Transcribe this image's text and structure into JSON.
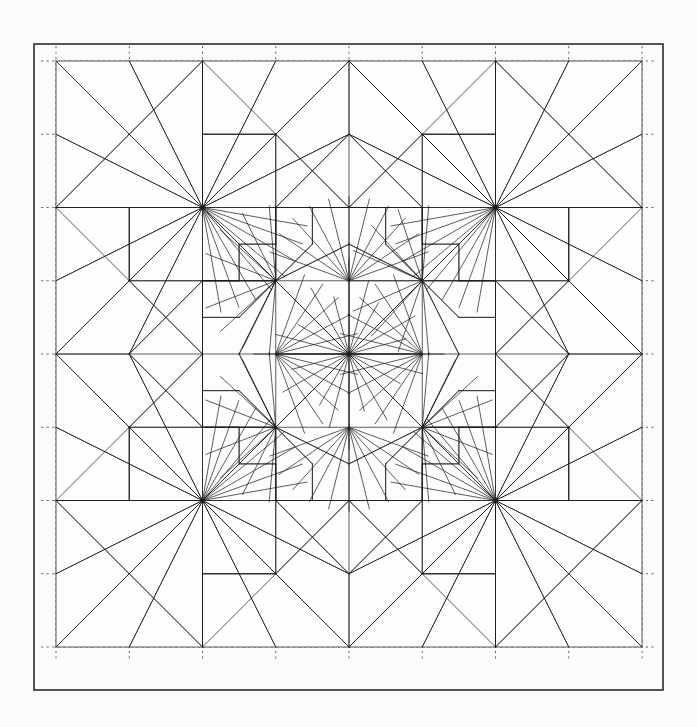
{
  "document": {
    "kind": "origami-crease-pattern",
    "title": "Crease Pattern",
    "caption": ""
  },
  "canvas": {
    "width": 697,
    "height": 727,
    "background_color": "#fbfbfa"
  },
  "frame": {
    "label": "outer-frame",
    "x": 34,
    "y": 44,
    "width": 629,
    "height": 646,
    "stroke_color": "#2b2b2b",
    "stroke_width": 1.6
  },
  "paper": {
    "label": "paper-square",
    "x": 56,
    "y": 61,
    "size": 586,
    "grid_divisions": 16,
    "stroke_color": "#555555"
  },
  "styles": {
    "crease_color": "#1d1d1d",
    "crease_width": 0.72,
    "guide_color": "#4a4a4a",
    "guide_width": 0.85,
    "guide_dash": "2.2 3.4"
  },
  "chart_data": {
    "type": "diagram",
    "grid": {
      "divisions": 16,
      "origin_x": 56,
      "origin_y": 61,
      "cell": 36.625,
      "guide_lines_at": [
        2,
        4,
        6,
        8,
        10,
        12,
        14
      ],
      "guide_overhang": 15
    },
    "symmetry": {
      "type": "dihedral-4",
      "center_u": 8,
      "center_v": 8,
      "mirrors": [
        "vertical",
        "horizontal",
        "diagonal",
        "antidiagonal"
      ]
    },
    "center_vertex": {
      "u": 8,
      "v": 8
    },
    "major_vertices": [
      {
        "u": 4,
        "v": 0
      },
      {
        "u": 8,
        "v": 0
      },
      {
        "u": 12,
        "v": 0
      },
      {
        "u": 0,
        "v": 4
      },
      {
        "u": 0,
        "v": 8
      },
      {
        "u": 0,
        "v": 12
      },
      {
        "u": 16,
        "v": 4
      },
      {
        "u": 16,
        "v": 8
      },
      {
        "u": 16,
        "v": 12
      },
      {
        "u": 4,
        "v": 16
      },
      {
        "u": 8,
        "v": 16
      },
      {
        "u": 12,
        "v": 16
      },
      {
        "u": 4,
        "v": 4
      },
      {
        "u": 12,
        "v": 4
      },
      {
        "u": 4,
        "v": 12
      },
      {
        "u": 12,
        "v": 12
      },
      {
        "u": 6,
        "v": 6
      },
      {
        "u": 10,
        "v": 6
      },
      {
        "u": 6,
        "v": 10
      },
      {
        "u": 10,
        "v": 10
      },
      {
        "u": 8,
        "v": 6
      },
      {
        "u": 6,
        "v": 8
      },
      {
        "u": 10,
        "v": 8
      },
      {
        "u": 8,
        "v": 10
      }
    ],
    "motifs": [
      {
        "name": "central-star",
        "center": [
          8,
          8
        ],
        "rays": 24,
        "radius_cells": 2.6
      },
      {
        "name": "inner-petal-nw",
        "center": [
          6,
          6
        ]
      },
      {
        "name": "inner-petal-ne",
        "center": [
          10,
          6
        ]
      },
      {
        "name": "inner-petal-sw",
        "center": [
          6,
          10
        ]
      },
      {
        "name": "inner-petal-se",
        "center": [
          10,
          10
        ]
      },
      {
        "name": "edge-fan-top",
        "center": [
          8,
          6
        ]
      },
      {
        "name": "edge-fan-bottom",
        "center": [
          8,
          10
        ]
      },
      {
        "name": "edge-fan-left",
        "center": [
          6,
          8
        ]
      },
      {
        "name": "edge-fan-right",
        "center": [
          10,
          8
        ]
      },
      {
        "name": "corner-fan-nw",
        "center": [
          4,
          4
        ]
      },
      {
        "name": "corner-fan-ne",
        "center": [
          12,
          4
        ]
      },
      {
        "name": "corner-fan-sw",
        "center": [
          4,
          12
        ]
      },
      {
        "name": "corner-fan-se",
        "center": [
          12,
          12
        ]
      },
      {
        "name": "border-fan-n1",
        "center": [
          4,
          0
        ]
      },
      {
        "name": "border-fan-n2",
        "center": [
          8,
          0
        ]
      },
      {
        "name": "border-fan-n3",
        "center": [
          12,
          0
        ]
      },
      {
        "name": "border-fan-s1",
        "center": [
          4,
          16
        ]
      },
      {
        "name": "border-fan-s2",
        "center": [
          8,
          16
        ]
      },
      {
        "name": "border-fan-s3",
        "center": [
          12,
          16
        ]
      },
      {
        "name": "border-fan-w1",
        "center": [
          0,
          4
        ]
      },
      {
        "name": "border-fan-w2",
        "center": [
          0,
          8
        ]
      },
      {
        "name": "border-fan-w3",
        "center": [
          0,
          12
        ]
      },
      {
        "name": "border-fan-e1",
        "center": [
          16,
          4
        ]
      },
      {
        "name": "border-fan-e2",
        "center": [
          16,
          8
        ]
      },
      {
        "name": "border-fan-e3",
        "center": [
          16,
          12
        ]
      }
    ]
  }
}
